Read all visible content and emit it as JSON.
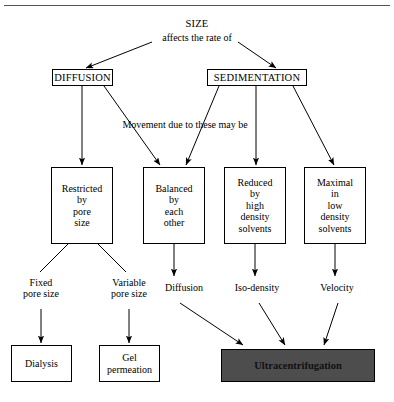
{
  "figure": {
    "title": "SIZE",
    "kind": "flowchart",
    "accent_fill": "#4d4d4d",
    "line_color": "#000000",
    "background": "#ffffff"
  },
  "nodes": {
    "size": "SIZE",
    "affects": "affects the rate of",
    "diffusion_head": "DIFFUSION",
    "sedimentation_head": "SEDIMENTATION",
    "movement_note": "Movement due to these may be",
    "restricted": "Restricted\nby\npore\nsize",
    "balanced": "Balanced\nby\neach\nother",
    "reduced": "Reduced\nby\nhigh\ndensity\nsolvents",
    "maximal": "Maximal\nin\nlow\ndensity\nsolvents",
    "fixed_pore": "Fixed\npore size",
    "variable_pore": "Variable\npore size",
    "diffusion_label": "Diffusion",
    "iso_density": "Iso-density",
    "velocity": "Velocity",
    "dialysis": "Dialysis",
    "gel_permeation": "Gel\npermeation",
    "ultracentrifugation": "Ultracentrifugation"
  },
  "edges": [
    {
      "from": "affects",
      "to": "diffusion_head",
      "style": "arrow"
    },
    {
      "from": "affects",
      "to": "sedimentation_head",
      "style": "arrow"
    },
    {
      "from": "diffusion_head",
      "to": "restricted",
      "style": "arrow"
    },
    {
      "from": "diffusion_head",
      "to": "balanced",
      "style": "arrow"
    },
    {
      "from": "sedimentation_head",
      "to": "balanced",
      "style": "arrow"
    },
    {
      "from": "sedimentation_head",
      "to": "reduced",
      "style": "arrow"
    },
    {
      "from": "sedimentation_head",
      "to": "maximal",
      "style": "arrow"
    },
    {
      "from": "restricted",
      "to": "fixed_pore",
      "style": "line"
    },
    {
      "from": "restricted",
      "to": "variable_pore",
      "style": "line"
    },
    {
      "from": "balanced",
      "to": "diffusion_label",
      "style": "arrow"
    },
    {
      "from": "reduced",
      "to": "iso_density",
      "style": "arrow"
    },
    {
      "from": "maximal",
      "to": "velocity",
      "style": "arrow"
    },
    {
      "from": "fixed_pore",
      "to": "dialysis",
      "style": "arrow"
    },
    {
      "from": "variable_pore",
      "to": "gel_permeation",
      "style": "arrow"
    },
    {
      "from": "diffusion_label",
      "to": "ultracentrifugation",
      "style": "arrow"
    },
    {
      "from": "iso_density",
      "to": "ultracentrifugation",
      "style": "arrow"
    },
    {
      "from": "velocity",
      "to": "ultracentrifugation",
      "style": "arrow"
    }
  ]
}
